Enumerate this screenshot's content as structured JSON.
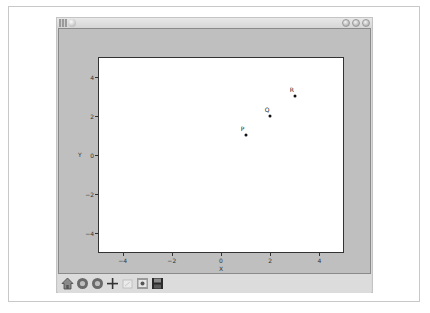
{
  "window": {
    "title": "",
    "titlebar_buttons": [
      "minimize",
      "maximize",
      "close"
    ]
  },
  "toolbar": {
    "items": [
      {
        "name": "home",
        "icon": "home-icon",
        "tooltip": "Reset original view"
      },
      {
        "name": "back",
        "icon": "back-icon",
        "tooltip": "Back to previous view"
      },
      {
        "name": "forward",
        "icon": "forward-icon",
        "tooltip": "Forward to next view"
      },
      {
        "name": "pan",
        "icon": "move-icon",
        "tooltip": "Pan axes"
      },
      {
        "name": "zoom",
        "icon": "zoom-rect-icon",
        "tooltip": "Zoom to rectangle"
      },
      {
        "name": "subplots",
        "icon": "configure-subplots-icon",
        "tooltip": "Configure subplots"
      },
      {
        "name": "save",
        "icon": "save-icon",
        "tooltip": "Save the figure"
      }
    ]
  },
  "chart_data": {
    "type": "scatter",
    "title": "",
    "xlabel": "X",
    "ylabel": "Y",
    "xlim": [
      -5,
      5
    ],
    "ylim": [
      -5,
      5
    ],
    "grid": false,
    "x_ticks": [
      -4,
      -2,
      0,
      2,
      4
    ],
    "y_ticks": [
      -4,
      -2,
      0,
      2,
      4
    ],
    "x_tick_labels": [
      "−4",
      "−2",
      "0",
      "2",
      "4"
    ],
    "y_tick_labels": [
      "4",
      "2",
      "0",
      "−2",
      "−4"
    ],
    "points": [
      {
        "label": "P",
        "x": 1,
        "y": 1
      },
      {
        "label": "Q",
        "x": 2,
        "y": 2
      },
      {
        "label": "R",
        "x": 3,
        "y": 3
      }
    ],
    "marker_color": "#111111"
  },
  "colors": {
    "figure_bg": "#bfbfbf",
    "axes_bg": "#ffffff",
    "window_bg": "#d9d9d9"
  }
}
